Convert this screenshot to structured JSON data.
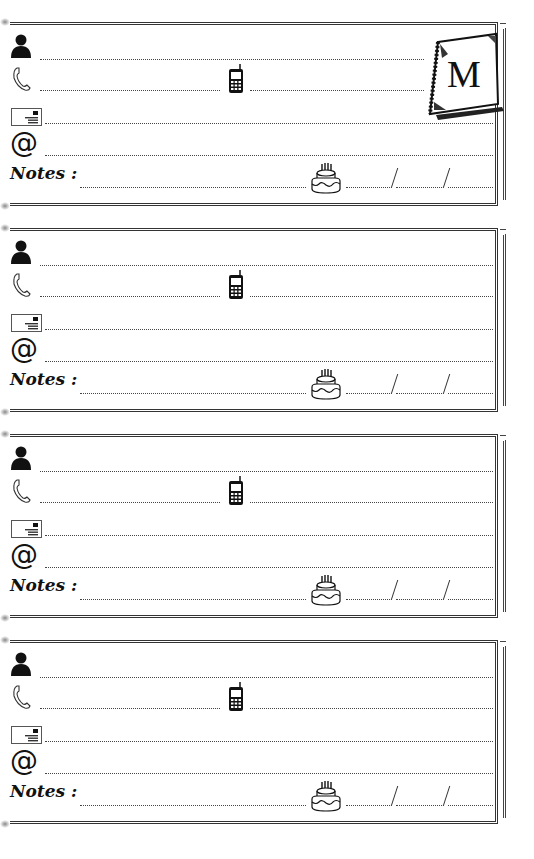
{
  "page": {
    "type": "address book page",
    "letter": "M",
    "colors": {
      "ink": "#111111",
      "line": "#444444",
      "border": "#333333",
      "paper": "#ffffff"
    }
  },
  "cards": [
    {
      "top": 22,
      "notes_label": "Notes :",
      "date_separators": [
        "/",
        "/"
      ],
      "has_letter_tab": true
    },
    {
      "top": 228,
      "notes_label": "Notes :",
      "date_separators": [
        "/",
        "/"
      ],
      "has_letter_tab": false
    },
    {
      "top": 434,
      "notes_label": "Notes :",
      "date_separators": [
        "/",
        "/"
      ],
      "has_letter_tab": false
    },
    {
      "top": 640,
      "notes_label": "Notes :",
      "date_separators": [
        "/",
        "/"
      ],
      "has_letter_tab": false
    }
  ],
  "icons": {
    "name": "person-icon",
    "phone": "phone-handset-icon",
    "mobile": "mobile-phone-icon",
    "address": "envelope-icon",
    "email": "at-sign-icon",
    "birthday": "birthday-cake-icon",
    "tab": "notebook-icon"
  },
  "symbols": {
    "at": "@"
  },
  "fields": {
    "name": "",
    "phone": "",
    "mobile": "",
    "address": "",
    "email": "",
    "notes": "",
    "birthday_day": "",
    "birthday_month": "",
    "birthday_year": ""
  }
}
